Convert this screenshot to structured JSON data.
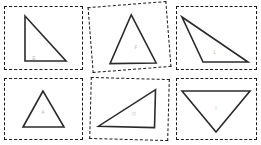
{
  "canvas": {
    "width": 261,
    "height": 145,
    "background": "#ffffff"
  },
  "style": {
    "cell_border_color": "#1a1a1a",
    "shape_stroke_color": "#2b2b2b",
    "shape_fill_color": "#ffffff",
    "label_color": "#b9b9b9"
  },
  "grid": {
    "rows": 2,
    "columns": 3
  },
  "cells": [
    {
      "id": "cell-1",
      "name": "right-triangle-left-angle",
      "label": "E",
      "rotation": 0,
      "box": {
        "x": 4,
        "y": 6,
        "w": 79,
        "h": 64
      },
      "label_pos": {
        "x": 30,
        "y": 52
      },
      "points": "21,10 21,55 62,55"
    },
    {
      "id": "cell-2",
      "name": "acute-triangle-upright-rotated-cell",
      "label": "F",
      "rotation": -4.5,
      "box": {
        "x": 90,
        "y": 4,
        "w": 79,
        "h": 66
      },
      "label_pos": {
        "x": 45,
        "y": 44
      },
      "points": "43,11 18,58 64,61"
    },
    {
      "id": "cell-3",
      "name": "obtuse-thin-triangle",
      "label": "L",
      "rotation": 0,
      "box": {
        "x": 176,
        "y": 6,
        "w": 81,
        "h": 64
      },
      "label_pos": {
        "x": 39,
        "y": 46
      },
      "points": "6,11 72,56 27,56"
    },
    {
      "id": "cell-4",
      "name": "equilateral-triangle-upright",
      "label": "A",
      "rotation": 0,
      "box": {
        "x": 4,
        "y": 78,
        "w": 79,
        "h": 62
      },
      "label_pos": {
        "x": 39,
        "y": 34
      },
      "points": "39,13 19,49 60,49"
    },
    {
      "id": "cell-5",
      "name": "right-triangle-shallow",
      "label": "G",
      "rotation": 1.5,
      "box": {
        "x": 90,
        "y": 78,
        "w": 79,
        "h": 62
      },
      "label_pos": {
        "x": 44,
        "y": 36
      },
      "points": "65,11 65,49 9,49"
    },
    {
      "id": "cell-6",
      "name": "inverted-triangle",
      "label": "I",
      "rotation": 0,
      "box": {
        "x": 176,
        "y": 78,
        "w": 81,
        "h": 62
      },
      "label_pos": {
        "x": 40,
        "y": 30
      },
      "points": "6,13 74,13 40,54"
    }
  ]
}
